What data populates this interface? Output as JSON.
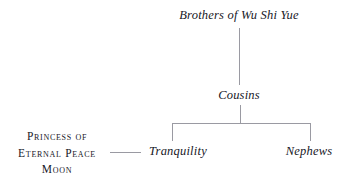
{
  "diagram": {
    "kind": "family-tree",
    "background_color": "#ffffff",
    "line_color": "#9a9aa2",
    "text_color": "#17171f",
    "nodes": {
      "brothers": "Brothers of Wu Shi Yue",
      "cousins": "Cousins",
      "tranquility": "Tranquility",
      "nephews": "Nephews",
      "princess": {
        "line1": "Princess of",
        "line2": "Eternal Peace",
        "line3": "Moon"
      }
    },
    "connectors": {
      "brothers_to_cousins": "vertical-line",
      "cousins_to_children": "vertical-line",
      "sibling_bracket": "horizontal-bar",
      "bracket_drop_left": "vertical-line",
      "bracket_drop_right": "vertical-line",
      "princess_to_tranquility": "horizontal-line"
    }
  }
}
